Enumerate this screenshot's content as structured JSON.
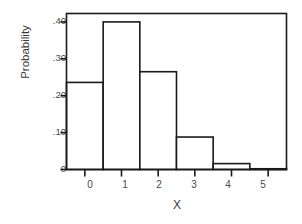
{
  "chart_data": {
    "type": "bar",
    "title": "",
    "subtitle": "",
    "xlabel": "X",
    "ylabel": "Probability",
    "categories": [
      "0",
      "1",
      "2",
      "3",
      "4",
      "5"
    ],
    "x": [
      0,
      1,
      2,
      3,
      4,
      5
    ],
    "values": [
      0.236,
      0.4,
      0.265,
      0.088,
      0.016,
      0.002
    ],
    "xlim": [
      -0.5,
      5.5
    ],
    "ylim": [
      0,
      0.4228
    ],
    "ytick_values": [
      0,
      0.1,
      0.2,
      0.3,
      0.4
    ],
    "ytick_labels": [
      "0",
      ".10",
      ".20",
      ".30",
      ".40"
    ],
    "xtick_values": [
      0,
      1,
      2,
      3,
      4,
      5
    ],
    "xtick_labels": [
      "0",
      "1",
      "2",
      "3",
      "4",
      "5"
    ],
    "grid": false,
    "legend": false,
    "legend_position": "none",
    "bar_fill": "#ffffff",
    "bar_edge": "#1a1a1a",
    "axis_color": "#1a1a1a",
    "background": "#ffffff",
    "bar_width": 1.0,
    "annotations": []
  }
}
